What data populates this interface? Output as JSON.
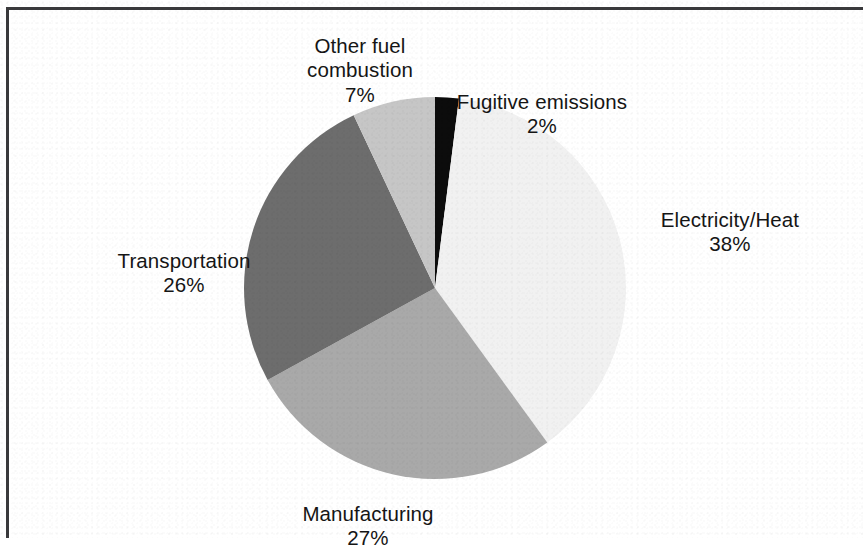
{
  "figure": {
    "background_color": "#ffffff",
    "frame_color": "#3a3a3c"
  },
  "chart_data": {
    "type": "pie",
    "title": "",
    "subtitle": "",
    "xlabel": "",
    "ylabel": "",
    "units": "percent",
    "legend_position": "none",
    "labels_position": "outside-callout",
    "start_angle_deg": 0,
    "direction": "clockwise",
    "total": 100,
    "categories": [
      "Fugitive emissions",
      "Electricity/Heat",
      "Manufacturing",
      "Transportation",
      "Other fuel combustion"
    ],
    "values": [
      2,
      38,
      27,
      26,
      7
    ],
    "value_labels": [
      "2%",
      "38%",
      "27%",
      "26%",
      "7%"
    ],
    "colors": [
      "#0c0c0c",
      "#f1f1f1",
      "#a9a9a9",
      "#6d6d6d",
      "#c6c6c6"
    ],
    "slices": [
      {
        "name": "Fugitive emissions",
        "label": "Fugitive emissions",
        "value": 2,
        "value_label": "2%",
        "color": "#0c0c0c",
        "start_deg": 0,
        "end_deg": 7.2
      },
      {
        "name": "Electricity/Heat",
        "label": "Electricity/Heat",
        "value": 38,
        "value_label": "38%",
        "color": "#f1f1f1",
        "start_deg": 7.2,
        "end_deg": 144
      },
      {
        "name": "Manufacturing",
        "label": "Manufacturing",
        "value": 27,
        "value_label": "27%",
        "color": "#a9a9a9",
        "start_deg": 144,
        "end_deg": 241.2
      },
      {
        "name": "Transportation",
        "label": "Transportation",
        "value": 26,
        "value_label": "26%",
        "color": "#6d6d6d",
        "start_deg": 241.2,
        "end_deg": 334.8
      },
      {
        "name": "Other fuel combustion",
        "label": "Other fuel combustion",
        "value": 7,
        "value_label": "7%",
        "color": "#c6c6c6",
        "start_deg": 334.8,
        "end_deg": 360
      }
    ]
  },
  "labels": {
    "other_fuel": {
      "name": "Other fuel\ncombustion",
      "pct": "7%"
    },
    "fugitive": {
      "name": "Fugitive emissions",
      "pct": "2%"
    },
    "electricity": {
      "name": "Electricity/Heat",
      "pct": "38%"
    },
    "transportation": {
      "name": "Transportation",
      "pct": "26%"
    },
    "manufacturing": {
      "name": "Manufacturing",
      "pct": "27%"
    }
  }
}
